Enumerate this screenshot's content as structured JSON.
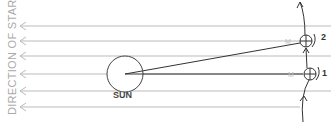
{
  "diagram": {
    "axis_label": "DIRECTION OF STARS",
    "sun_label": "SUN",
    "position_labels": [
      "1",
      "2"
    ],
    "marker_label": "M",
    "star_lines_y": [
      26,
      41,
      56,
      74,
      91,
      107
    ],
    "colors": {
      "lines": "#bbbbbb",
      "ink": "#333333",
      "label": "#aaaaaa"
    }
  }
}
